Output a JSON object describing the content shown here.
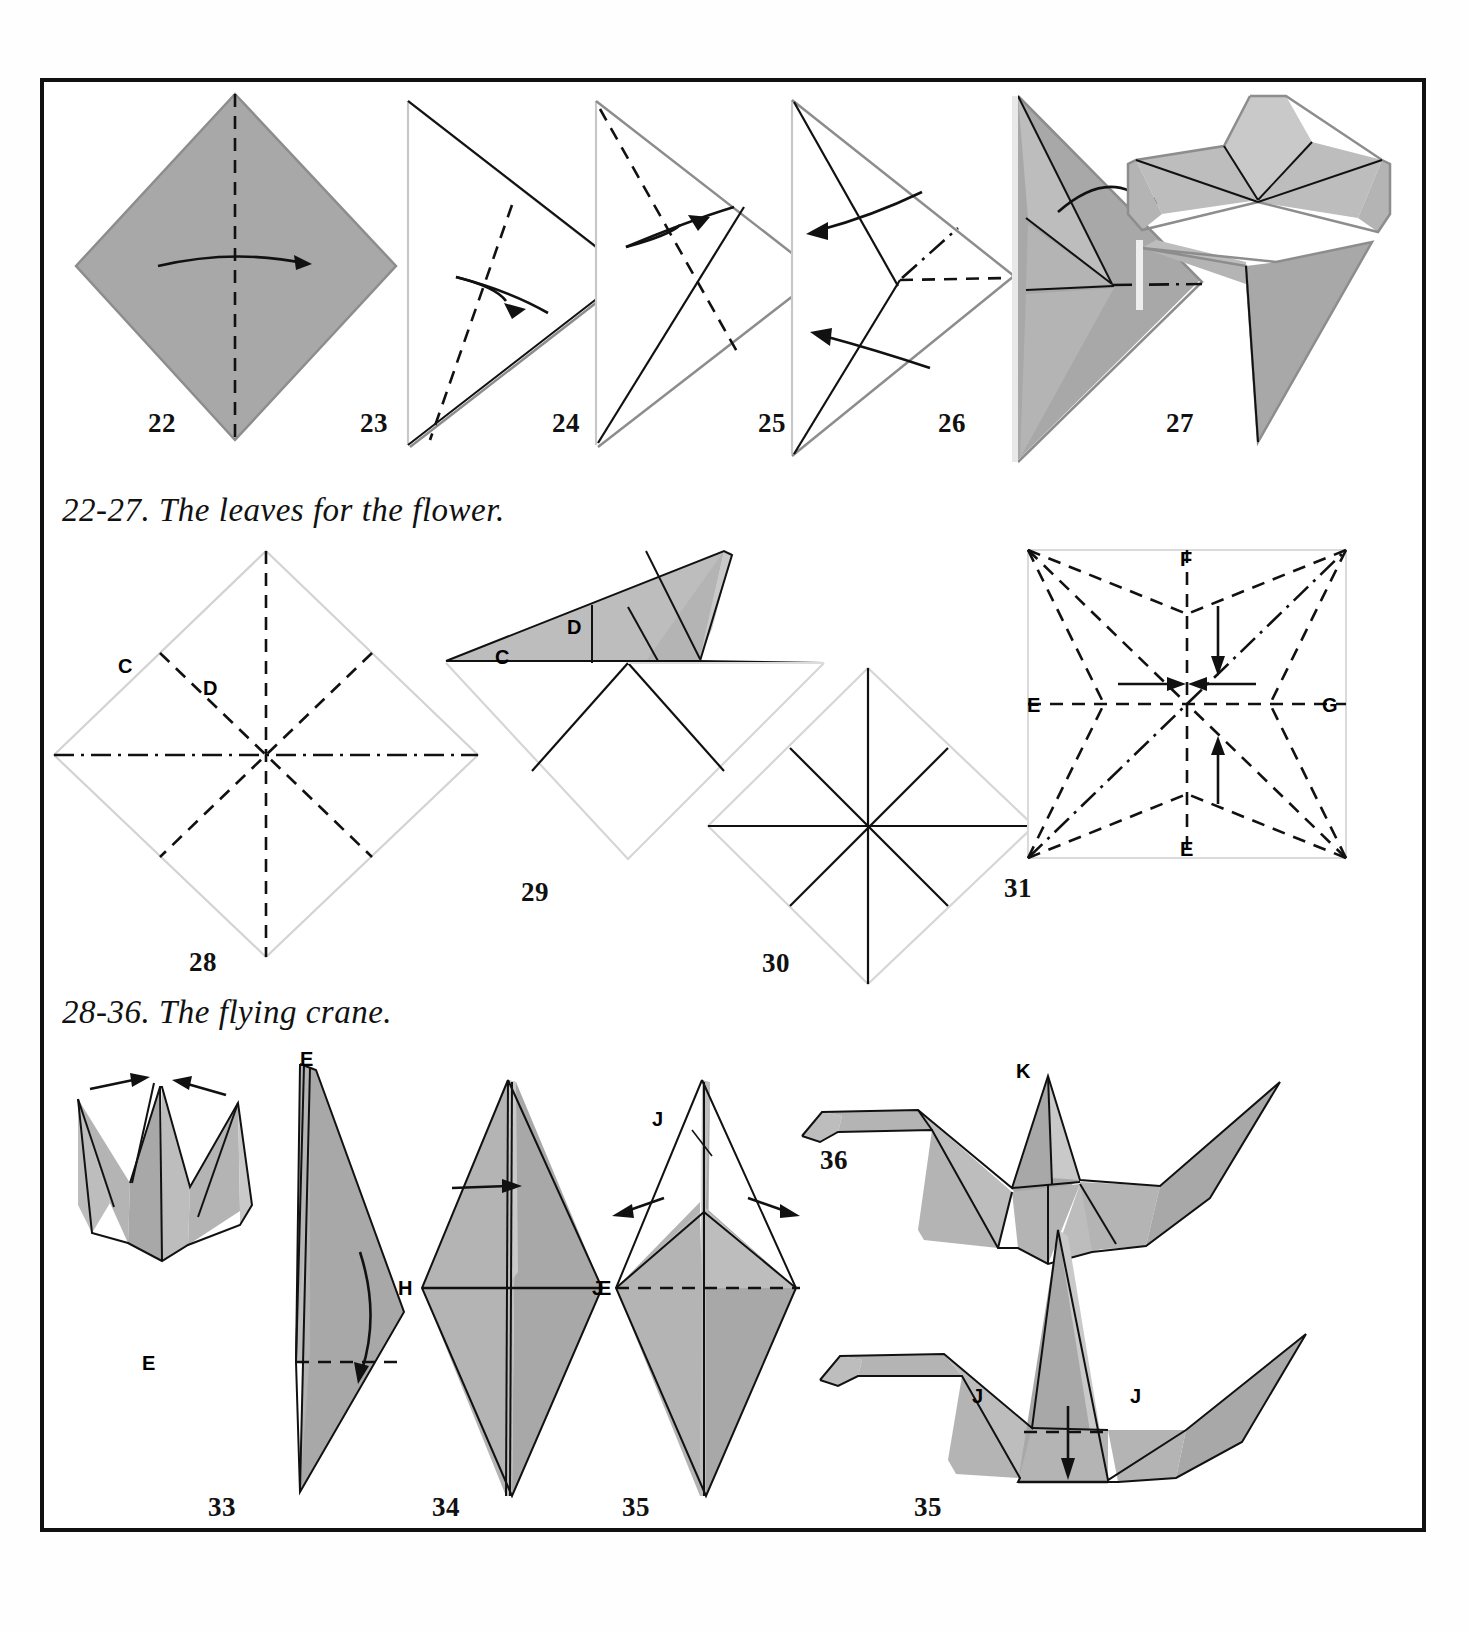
{
  "page": {
    "background": "#ffffff",
    "frame_color": "#111111",
    "paper_gray": "#a8a8a8"
  },
  "captions": [
    {
      "id": "caption-leaves",
      "text": "22-27. The leaves for the flower."
    },
    {
      "id": "caption-crane",
      "text": "28-36. The flying crane."
    }
  ],
  "figures": [
    {
      "number": "22",
      "name": "square-with-vertical-fold",
      "labels": [],
      "arrows": [
        "curved-right"
      ]
    },
    {
      "number": "23",
      "name": "triangle-with-diagonal-fold",
      "labels": [],
      "arrows": [
        "fold-right"
      ]
    },
    {
      "number": "24",
      "name": "triangle-with-crossed-fold",
      "labels": [],
      "arrows": [
        "fold-up-right"
      ]
    },
    {
      "number": "25",
      "name": "triangle-with-two-left-arrows",
      "labels": [],
      "arrows": [
        "left",
        "left"
      ]
    },
    {
      "number": "26",
      "name": "folded-leaf-photo",
      "labels": [],
      "arrows": [
        "curved-over"
      ]
    },
    {
      "number": "27",
      "name": "finished-leaves-photo",
      "labels": [],
      "arrows": []
    },
    {
      "number": "28",
      "name": "crane-base-creases-diamond",
      "labels": [
        "C",
        "D"
      ],
      "arrows": []
    },
    {
      "number": "29",
      "name": "folded-flap-with-cd",
      "labels": [
        "C",
        "D"
      ],
      "arrows": []
    },
    {
      "number": "30",
      "name": "diamond-eight-solid-creases",
      "labels": [],
      "arrows": []
    },
    {
      "number": "31",
      "name": "square-crease-pattern-star",
      "labels": [
        "E",
        "E",
        "E",
        "E",
        "G"
      ],
      "arrows": [
        "down",
        "right",
        "left",
        "up"
      ]
    },
    {
      "number": "32",
      "name": "kite-base-photo",
      "labels": [
        "F",
        "E",
        "E",
        "G"
      ],
      "arrows": [
        "curved-down"
      ]
    },
    {
      "number": "33",
      "name": "narrowed-diamond-photo",
      "labels": [
        "E",
        "E"
      ],
      "arrows": [
        "right"
      ]
    },
    {
      "number": "34",
      "name": "head-tail-fold-photo",
      "labels": [
        "H",
        "E",
        "E"
      ],
      "arrows": [
        "out-left",
        "out-right"
      ]
    },
    {
      "number": "35",
      "name": "crane-with-jj-fold-photo",
      "labels": [
        "J",
        "J"
      ],
      "arrows": [
        "down"
      ]
    },
    {
      "number": "36",
      "name": "finished-flying-crane-photo",
      "labels": [
        "K"
      ],
      "arrows": []
    }
  ],
  "fold_legend": {
    "dashed": "valley fold line",
    "dash_dot": "mountain fold line",
    "solid": "existing crease or edge",
    "arrow": "fold direction"
  }
}
